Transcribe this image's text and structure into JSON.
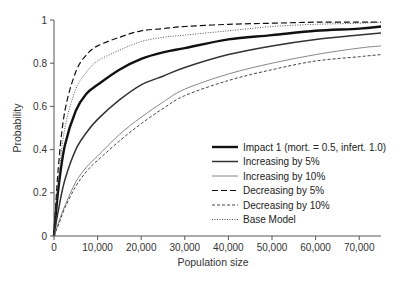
{
  "chart_data": {
    "type": "line",
    "title": "",
    "xlabel": "Population size",
    "ylabel": "Probability",
    "xlim": [
      0,
      75000
    ],
    "ylim": [
      0,
      1
    ],
    "grid": false,
    "legend_position": "lower right",
    "x_ticks": [
      0,
      10000,
      20000,
      30000,
      40000,
      50000,
      60000,
      70000
    ],
    "x_tick_labels": [
      "0",
      "10,000",
      "20,000",
      "30,000",
      "40,000",
      "50,000",
      "60,000",
      "70,000"
    ],
    "y_ticks": [
      0,
      0.2,
      0.4,
      0.6,
      0.8,
      1
    ],
    "y_tick_labels": [
      "0",
      "0.2",
      "0.4",
      "0.6",
      "0.8",
      "1"
    ],
    "x": [
      0,
      1000,
      2500,
      5000,
      7500,
      10000,
      15000,
      20000,
      25000,
      30000,
      40000,
      50000,
      60000,
      70000,
      75000
    ],
    "series": [
      {
        "name": "Impact 1 (mort. = 0.5, infert. 1.0)",
        "style": "thick-solid",
        "color": "#111111",
        "values": [
          0,
          0.22,
          0.42,
          0.58,
          0.66,
          0.7,
          0.77,
          0.82,
          0.85,
          0.87,
          0.91,
          0.93,
          0.95,
          0.96,
          0.97
        ]
      },
      {
        "name": "Increasing by 5%",
        "style": "medium-solid",
        "color": "#333333",
        "values": [
          0,
          0.12,
          0.26,
          0.4,
          0.48,
          0.54,
          0.63,
          0.7,
          0.74,
          0.78,
          0.84,
          0.88,
          0.91,
          0.93,
          0.94
        ]
      },
      {
        "name": "Increasing by 10%",
        "style": "thin-solid",
        "color": "#888888",
        "values": [
          0,
          0.06,
          0.14,
          0.25,
          0.32,
          0.37,
          0.47,
          0.55,
          0.62,
          0.68,
          0.75,
          0.8,
          0.84,
          0.87,
          0.88
        ]
      },
      {
        "name": "Decreasing by 5%",
        "style": "long-dash",
        "color": "#111111",
        "values": [
          0,
          0.32,
          0.58,
          0.76,
          0.84,
          0.88,
          0.92,
          0.95,
          0.96,
          0.97,
          0.98,
          0.985,
          0.99,
          0.99,
          0.99
        ]
      },
      {
        "name": "Decreasing by 10%",
        "style": "short-dash",
        "color": "#444444",
        "values": [
          0,
          0.05,
          0.13,
          0.23,
          0.3,
          0.35,
          0.44,
          0.52,
          0.59,
          0.65,
          0.72,
          0.77,
          0.81,
          0.83,
          0.84
        ]
      },
      {
        "name": "Base Model",
        "style": "dotted",
        "color": "#555555",
        "values": [
          0,
          0.26,
          0.5,
          0.68,
          0.76,
          0.81,
          0.86,
          0.9,
          0.92,
          0.93,
          0.95,
          0.97,
          0.98,
          0.985,
          0.99
        ]
      }
    ]
  }
}
